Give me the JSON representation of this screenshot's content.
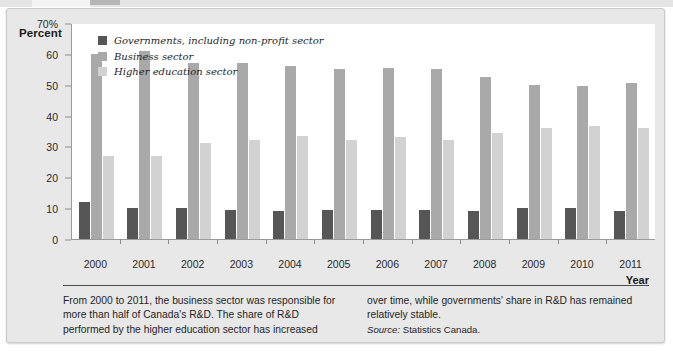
{
  "figure": {
    "y_axis_title": "Percent",
    "x_axis_title": "Year"
  },
  "legend": [
    {
      "label": "Governments, including non-profit sector",
      "color": "#565656",
      "key": "governments"
    },
    {
      "label": "Business sector",
      "color": "#a9a9a9",
      "key": "business"
    },
    {
      "label": "Higher education sector",
      "color": "#d2d2d2",
      "key": "higher_education"
    }
  ],
  "y_ticks": [
    {
      "label": "70%",
      "value": 70
    },
    {
      "label": "60",
      "value": 60
    },
    {
      "label": "50",
      "value": 50
    },
    {
      "label": "40",
      "value": 40
    },
    {
      "label": "30",
      "value": 30
    },
    {
      "label": "20",
      "value": 20
    },
    {
      "label": "10",
      "value": 10
    },
    {
      "label": "0",
      "value": 0
    }
  ],
  "caption": {
    "left_text": "From 2000 to 2011, the business sector was responsible for more than half of Canada's R&D. The share of R&D performed by the higher education sector has increased",
    "right_text": "over time, while governments' share in R&D has remained relatively stable.",
    "source_prefix": "Source:",
    "source_value": "Statistics Canada."
  },
  "chart_data": {
    "type": "bar",
    "title": "",
    "subtitle": "",
    "xlabel": "Year",
    "ylabel": "Percent",
    "ylim": [
      0,
      70
    ],
    "ytick_step": 10,
    "grid": false,
    "legend_position": "top-left",
    "categories": [
      "2000",
      "2001",
      "2002",
      "2003",
      "2004",
      "2005",
      "2006",
      "2007",
      "2008",
      "2009",
      "2010",
      "2011"
    ],
    "series": [
      {
        "name": "Governments, including non-profit sector",
        "color": "#565656",
        "values": [
          12,
          10,
          10,
          9.5,
          9,
          9.5,
          9.5,
          9.5,
          9,
          10,
          10,
          9
        ]
      },
      {
        "name": "Business sector",
        "color": "#a9a9a9",
        "values": [
          60,
          61,
          57,
          57,
          56,
          55,
          55.5,
          55,
          52.5,
          50,
          49.5,
          50.5
        ]
      },
      {
        "name": "Higher education sector",
        "color": "#d2d2d2",
        "values": [
          27,
          27,
          31,
          32,
          33.5,
          32,
          33,
          32,
          34.5,
          36,
          36.5,
          36
        ]
      }
    ]
  }
}
